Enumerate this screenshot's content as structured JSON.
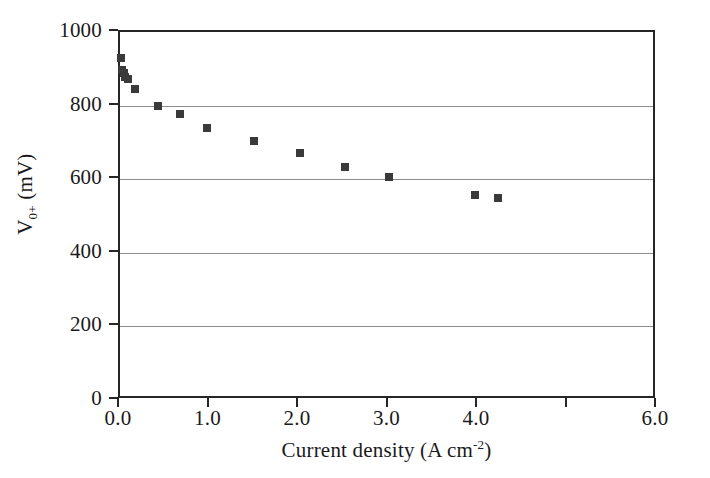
{
  "chart_data": {
    "type": "scatter",
    "title": "",
    "xlabel": "Current density (A cm<sup>-2</sup>)",
    "xlabel_text": "Current density (A cm",
    "xlabel_exponent": "-2",
    "xlabel_tail": ")",
    "ylabel_main": "V",
    "ylabel_sub": "0+",
    "ylabel_unit": " (mV)",
    "ylabel": "V0+ (mV)",
    "xlim": [
      0.0,
      6.0
    ],
    "ylim": [
      0,
      1000
    ],
    "grid": true,
    "grid_axis": "y",
    "legend": false,
    "marker": "square",
    "marker_color": "#3a3a3a",
    "xticks": [
      0.0,
      1.0,
      2.0,
      3.0,
      4.0,
      5.0,
      6.0
    ],
    "xtick_labels": [
      "0.0",
      "1.0",
      "2.0",
      "3.0",
      "4.0",
      "",
      "6.0"
    ],
    "yticks": [
      0,
      200,
      400,
      600,
      800,
      1000
    ],
    "ytick_labels": [
      "0",
      "200",
      "400",
      "600",
      "800",
      "1000"
    ],
    "gridline_values": [
      200,
      400,
      600,
      800
    ],
    "x": [
      0.01,
      0.02,
      0.04,
      0.06,
      0.09,
      0.17,
      0.43,
      0.67,
      0.97,
      1.5,
      2.01,
      2.51,
      3.0,
      3.97,
      4.22
    ],
    "y": [
      930,
      897,
      888,
      878,
      872,
      845,
      800,
      778,
      740,
      705,
      670,
      633,
      607,
      558,
      548
    ],
    "points": [
      {
        "x": 0.01,
        "y": 930
      },
      {
        "x": 0.02,
        "y": 897
      },
      {
        "x": 0.04,
        "y": 888
      },
      {
        "x": 0.06,
        "y": 878
      },
      {
        "x": 0.09,
        "y": 872
      },
      {
        "x": 0.17,
        "y": 845
      },
      {
        "x": 0.43,
        "y": 800
      },
      {
        "x": 0.67,
        "y": 778
      },
      {
        "x": 0.97,
        "y": 740
      },
      {
        "x": 1.5,
        "y": 705
      },
      {
        "x": 2.01,
        "y": 670
      },
      {
        "x": 2.51,
        "y": 633
      },
      {
        "x": 3.0,
        "y": 607
      },
      {
        "x": 3.97,
        "y": 558
      },
      {
        "x": 4.22,
        "y": 548
      }
    ]
  },
  "colors": {
    "background": "#ffffff",
    "axis": "#262626",
    "grid": "#8c8c8c",
    "marker": "#3a3a3a",
    "text": "#1a1a1a"
  }
}
